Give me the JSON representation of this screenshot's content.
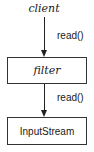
{
  "diagram": {
    "nodes": [
      {
        "id": "client",
        "label": "client",
        "style": "plain-italic"
      },
      {
        "id": "filter",
        "label": "filter",
        "style": "box-italic"
      },
      {
        "id": "inputstream",
        "label": "InputStream",
        "style": "box"
      }
    ],
    "edges": [
      {
        "from": "client",
        "to": "filter",
        "label": "read()"
      },
      {
        "from": "filter",
        "to": "inputstream",
        "label": "read()"
      }
    ]
  }
}
